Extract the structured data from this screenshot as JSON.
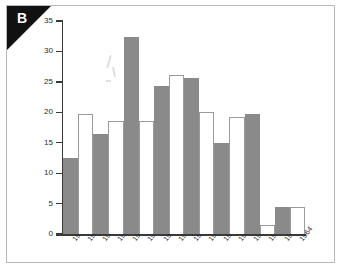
{
  "figure": {
    "panel_letter": "B",
    "ylabel": "Thousands of People"
  },
  "chart_data": {
    "type": "bar",
    "title": "",
    "xlabel": "",
    "ylabel": "Thousands of People",
    "ylim": [
      0,
      35
    ],
    "yticks": [
      0,
      5,
      10,
      15,
      20,
      25,
      30,
      35
    ],
    "ytick_labels": [
      "0",
      "5",
      "10",
      "15",
      "20",
      "25",
      "30",
      "35"
    ],
    "grid": false,
    "legend": "none",
    "bar_styles": [
      "filled",
      "open",
      "filled",
      "open",
      "filled",
      "open",
      "filled",
      "open",
      "filled",
      "open",
      "filled",
      "open",
      "filled",
      "open",
      "filled",
      "open"
    ],
    "colors": {
      "filled": "#8a8a8a",
      "open": "#ffffff",
      "open_edge": "#9b9b9b",
      "axis": "#3a3a3a",
      "frame": "#b9b9b9",
      "corner_flag": "#111111"
    },
    "categories": [
      "1949",
      "1950",
      "1951",
      "1952",
      "1953",
      "1954",
      "1955",
      "1956",
      "1957",
      "1958",
      "1959",
      "1960",
      "1961",
      "1962",
      "1963",
      "1964"
    ],
    "values": [
      12.5,
      19.7,
      16.5,
      18.6,
      32.4,
      18.5,
      24.4,
      26.2,
      25.7,
      20.0,
      15.0,
      19.2,
      19.7,
      1.5,
      4.5,
      4.4
    ]
  }
}
